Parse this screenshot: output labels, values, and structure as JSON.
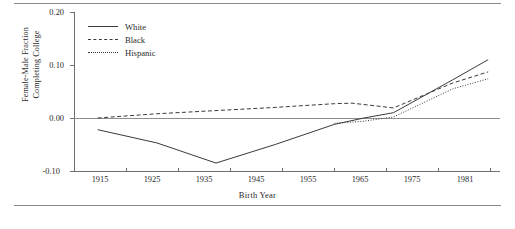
{
  "figure": {
    "ylabel_line1": "Female-Male Fraction",
    "ylabel_line2": "Completing College",
    "xlabel": "Birth Year"
  },
  "legend": {
    "position": "top-left-inside",
    "items": [
      {
        "label": "White",
        "style": "solid"
      },
      {
        "label": "Black",
        "style": "dashed"
      },
      {
        "label": "Hispanic",
        "style": "dotted"
      }
    ]
  },
  "axis": {
    "yticks": [
      "0.20",
      "0.10",
      "0.00",
      "-0.10"
    ],
    "xticks": [
      "1915",
      "1925",
      "1935",
      "1945",
      "1955",
      "1965",
      "1975",
      "1981"
    ]
  },
  "colors": {
    "line": "#3a3a3a",
    "axis": "#6f6f6f",
    "zero_line": "#8d8d8d",
    "rule": "#8a8a8a",
    "text": "#2b2b2b",
    "background": "#ffffff"
  },
  "chart_data": {
    "type": "line",
    "title": "",
    "xlabel": "Birth Year",
    "ylabel": "Female-Male Fraction Completing College",
    "xlim": [
      1911,
      1983
    ],
    "ylim": [
      -0.1,
      0.2
    ],
    "ytick_values": [
      0.2,
      0.1,
      0.0,
      -0.1
    ],
    "xtick_values": [
      1915,
      1925,
      1935,
      1945,
      1955,
      1965,
      1975,
      1981
    ],
    "grid": false,
    "zero_reference_line": true,
    "legend_entries": [
      "White",
      "Black",
      "Hispanic"
    ],
    "series": [
      {
        "name": "White",
        "style": "solid",
        "x": [
          1915,
          1925,
          1935,
          1945,
          1955,
          1960,
          1965,
          1975,
          1981
        ],
        "values": [
          -0.022,
          -0.047,
          -0.085,
          -0.05,
          -0.012,
          0.0,
          0.01,
          0.072,
          0.11
        ]
      },
      {
        "name": "Black",
        "style": "dashed",
        "x": [
          1915,
          1925,
          1935,
          1945,
          1955,
          1958,
          1965,
          1975,
          1981
        ],
        "values": [
          0.0,
          0.008,
          0.014,
          0.02,
          0.027,
          0.028,
          0.019,
          0.066,
          0.087
        ]
      },
      {
        "name": "Hispanic",
        "style": "dotted",
        "x": [
          1955,
          1960,
          1965,
          1975,
          1981
        ],
        "values": [
          -0.01,
          -0.006,
          0.002,
          0.055,
          0.074
        ]
      }
    ]
  }
}
